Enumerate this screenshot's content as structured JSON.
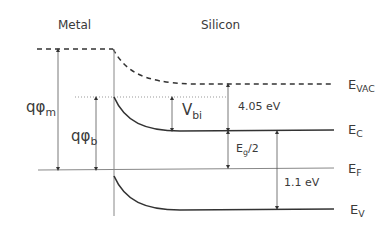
{
  "diagram": {
    "title_regions": {
      "metal": "Metal",
      "silicon": "Silicon"
    },
    "band_labels": {
      "vac": {
        "main": "E",
        "sub": "VAC"
      },
      "c": {
        "main": "E",
        "sub": "C"
      },
      "f": {
        "main": "E",
        "sub": "F"
      },
      "v": {
        "main": "E",
        "sub": "V"
      }
    },
    "annotations": {
      "phi_m": {
        "main": "qφ",
        "sub": "m"
      },
      "phi_b": {
        "main": "qφ",
        "sub": "b"
      },
      "vbi": {
        "main": "V",
        "sub": "bi"
      },
      "electron_affinity": "4.05 eV",
      "half_gap": {
        "main": "E",
        "sub": "g",
        "rest": "/2"
      },
      "band_gap": "1.1 eV"
    },
    "colors": {
      "line": "#333333",
      "thin_line": "#888888",
      "dotted": "#999999"
    }
  }
}
